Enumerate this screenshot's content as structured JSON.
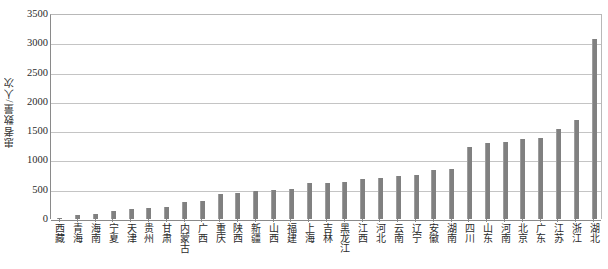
{
  "chart_data": {
    "type": "bar",
    "title": "",
    "xlabel": "",
    "ylabel": "患者数量/人次",
    "ylim": [
      0,
      3500
    ],
    "ytick_step": 500,
    "yticks": [
      0,
      500,
      1000,
      1500,
      2000,
      2500,
      3000,
      3500
    ],
    "ytick_labels": [
      "0",
      "500",
      "1000",
      "1500",
      "2000",
      "2500",
      "3000",
      "3500"
    ],
    "grid": true,
    "legend": "none",
    "bar_color": "#808080",
    "categories": [
      "西藏",
      "青海",
      "海南",
      "宁夏",
      "天津",
      "贵州",
      "甘肃",
      "内蒙古",
      "广西",
      "重庆",
      "陕西",
      "新疆",
      "山西",
      "福建",
      "上海",
      "吉林",
      "黑龙江",
      "江西",
      "河北",
      "云南",
      "辽宁",
      "安徽",
      "湖南",
      "四川",
      "山东",
      "河南",
      "北京",
      "广东",
      "江苏",
      "浙江",
      "湖北"
    ],
    "values": [
      20,
      70,
      80,
      130,
      170,
      180,
      210,
      290,
      310,
      420,
      450,
      470,
      490,
      520,
      610,
      620,
      640,
      680,
      700,
      730,
      750,
      830,
      850,
      1230,
      1290,
      1310,
      1360,
      1380,
      1540,
      1690,
      3070
    ]
  }
}
